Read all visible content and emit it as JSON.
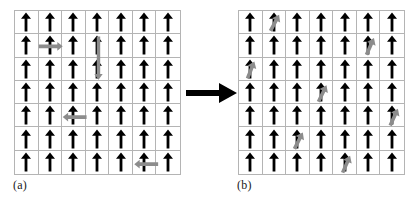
{
  "figure": {
    "type": "spin-lattice-diagram",
    "background_color": "#ffffff",
    "grid_line_color": "#b4b4b4",
    "black_arrow_color": "#000000",
    "gray_arrow_color": "#8c8c8c",
    "grid_rows": 7,
    "grid_cols": 7,
    "transition_arrow": {
      "direction": "right",
      "color": "#000000"
    }
  },
  "panels": [
    {
      "id": "a",
      "caption": "(a)",
      "rows": 7,
      "cols": 7,
      "base_arrow": "up",
      "base_arrow_color": "#000000",
      "overlay_arrows": [
        {
          "row": 2,
          "col": 2,
          "direction": "right",
          "color": "#8c8c8c",
          "double_headed": false
        },
        {
          "row": 3,
          "col": 4,
          "direction": "down",
          "color": "#8c8c8c",
          "double_headed": true,
          "spans_rows": 2
        },
        {
          "row": 5,
          "col": 3,
          "direction": "left",
          "color": "#8c8c8c",
          "double_headed": false
        },
        {
          "row": 7,
          "col": 6,
          "direction": "left",
          "color": "#8c8c8c",
          "double_headed": false
        }
      ]
    },
    {
      "id": "b",
      "caption": "(b)",
      "rows": 7,
      "cols": 7,
      "base_arrow": "up",
      "base_arrow_color": "#000000",
      "overlay_arrows": [
        {
          "row": 1,
          "col": 2,
          "direction": "tilted",
          "angle_deg": 28,
          "color": "#8c8c8c"
        },
        {
          "row": 2,
          "col": 6,
          "direction": "tilted",
          "angle_deg": 24,
          "color": "#8c8c8c"
        },
        {
          "row": 3,
          "col": 1,
          "direction": "tilted",
          "angle_deg": 22,
          "color": "#8c8c8c"
        },
        {
          "row": 4,
          "col": 4,
          "direction": "tilted",
          "angle_deg": 26,
          "color": "#8c8c8c"
        },
        {
          "row": 5,
          "col": 7,
          "direction": "tilted",
          "angle_deg": 25,
          "color": "#8c8c8c"
        },
        {
          "row": 6,
          "col": 3,
          "direction": "tilted",
          "angle_deg": 27,
          "color": "#8c8c8c"
        },
        {
          "row": 7,
          "col": 5,
          "direction": "tilted",
          "angle_deg": 24,
          "color": "#8c8c8c"
        }
      ]
    }
  ]
}
